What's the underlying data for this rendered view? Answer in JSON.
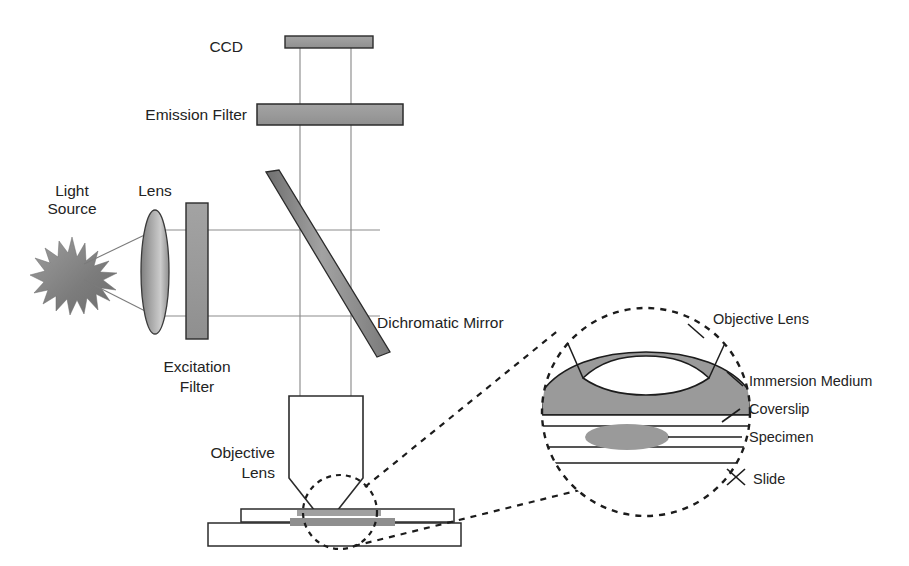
{
  "figure": {
    "type": "schematic-diagram",
    "background_color": "#ffffff",
    "line_color": "#232323",
    "beam_line_color": "#8a8a8a",
    "component_fill": "#9a9a9a",
    "component_stroke": "#2b2b2b"
  },
  "labels": {
    "ccd": "CCD",
    "emission_filter": "Emission Filter",
    "light_source_line1": "Light",
    "light_source_line2": "Source",
    "lens": "Lens",
    "excitation_filter_line1": "Excitation",
    "excitation_filter_line2": "Filter",
    "dichromatic_mirror": "Dichromatic Mirror",
    "objective_lens_line1": "Objective",
    "objective_lens_line2": "Lens",
    "inset_objective_lens": "Objective Lens",
    "inset_immersion_medium": "Immersion Medium",
    "inset_coverslip": "Coverslip",
    "inset_specimen": "Specimen",
    "inset_slide": "Slide"
  },
  "components": [
    {
      "name": "ccd-detector",
      "shape": "rectangle",
      "fill": "#9a9a9a"
    },
    {
      "name": "emission-filter",
      "shape": "rectangle",
      "fill": "#9a9a9a"
    },
    {
      "name": "dichromatic-mirror",
      "shape": "tilted-bar",
      "fill": "#8c8c8c"
    },
    {
      "name": "light-source",
      "shape": "starburst",
      "fill": "#8f8f8f"
    },
    {
      "name": "collector-lens",
      "shape": "ellipse",
      "fill": "#9d9d9d"
    },
    {
      "name": "excitation-filter",
      "shape": "rectangle",
      "fill": "#9a9a9a"
    },
    {
      "name": "objective-lens-body",
      "shape": "tapered-barrel",
      "fill": "#ffffff"
    },
    {
      "name": "coverslip",
      "shape": "rectangle",
      "fill": "#ffffff"
    },
    {
      "name": "slide",
      "shape": "rectangle",
      "fill": "#ffffff"
    },
    {
      "name": "specimen-smear",
      "shape": "rectangle",
      "fill": "#8f8f8f"
    },
    {
      "name": "magnifier-inset-circle",
      "shape": "dashed-circle",
      "fill": "#ffffff"
    },
    {
      "name": "immersion-medium",
      "shape": "dome",
      "fill": "#9a9a9a"
    },
    {
      "name": "inset-specimen-blob",
      "shape": "ellipse",
      "fill": "#9a9a9a"
    }
  ]
}
